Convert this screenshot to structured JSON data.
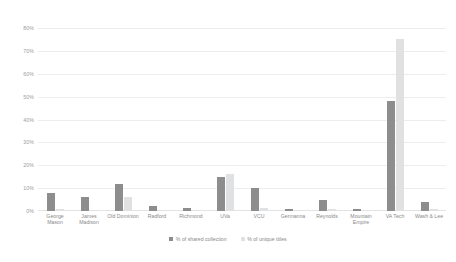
{
  "chart_data": {
    "type": "bar",
    "title": "",
    "xlabel": "",
    "ylabel": "",
    "ylim": [
      0,
      80
    ],
    "grid": true,
    "legend_position": "bottom",
    "categories": [
      "George Mason",
      "James Madison",
      "Old Dominion",
      "Radford",
      "Richmond",
      "UVa",
      "VCU",
      "Germanna",
      "Reynolds",
      "Mountain Empire",
      "VA Tech",
      "Wash & Lee"
    ],
    "series": [
      {
        "name": "% of shared collection",
        "color": "#8d8d8d",
        "values": [
          8,
          6,
          12,
          2,
          1.5,
          15,
          10,
          1,
          5,
          1,
          48,
          4
        ]
      },
      {
        "name": "% of unique titles",
        "color": "#e0e1e2",
        "values": [
          1,
          0.5,
          6,
          0.5,
          0.5,
          16,
          1.5,
          0.5,
          1,
          0.5,
          75,
          1
        ]
      }
    ],
    "y_ticks": [
      "0%",
      "10%",
      "20%",
      "30%",
      "40%",
      "50%",
      "60%",
      "70%",
      "80%"
    ],
    "y_tick_values": [
      0,
      10,
      20,
      30,
      40,
      50,
      60,
      70,
      80
    ]
  },
  "legend": {
    "items": [
      {
        "label": "% of shared collection",
        "color": "#8d8d8d"
      },
      {
        "label": "% of unique titles",
        "color": "#e0e1e2"
      }
    ]
  },
  "colors": {
    "shared": "#8d8d8d",
    "unique": "#e0e1e2",
    "gridline": "#eceded",
    "axis_text": "#8a8a8a",
    "background": "#ffffff"
  }
}
